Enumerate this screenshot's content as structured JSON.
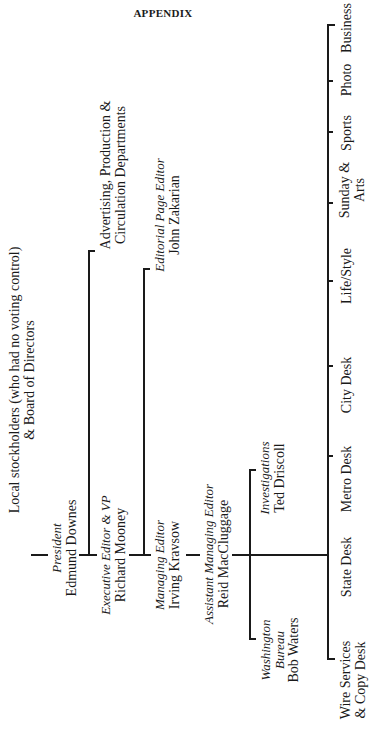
{
  "page": {
    "heading": "APPENDIX"
  },
  "chart": {
    "root": {
      "line1": "Local stockholders (who had no voting control)",
      "line2": "& Board of Directors"
    },
    "president": {
      "title": "President",
      "name": "Edmund Downes"
    },
    "executive_editor": {
      "title": "Executive Editor & VP",
      "name": "Richard Mooney"
    },
    "advertising": {
      "line1": "Advertising, Production &",
      "line2": "Circulation Departments"
    },
    "managing_editor": {
      "title": "Managing Editor",
      "name": "Irving Kravsow"
    },
    "editorial_page": {
      "title": "Editorial Page Editor",
      "name": "John Zakarian"
    },
    "assistant_managing_editor": {
      "title": "Assistant Managing Editor",
      "name": "Reid MacCluggage"
    },
    "washington": {
      "title1": "Washington",
      "title2": "Bureau",
      "name": "Bob Waters"
    },
    "investigations": {
      "title": "Investigations",
      "name": "Ted Driscoll"
    },
    "desks": [
      {
        "line1": "Wire Services",
        "line2": "& Copy Desk"
      },
      {
        "line1": "State Desk",
        "line2": ""
      },
      {
        "line1": "Metro Desk",
        "line2": ""
      },
      {
        "line1": "City Desk",
        "line2": ""
      },
      {
        "line1": "Life/Style",
        "line2": ""
      },
      {
        "line1": "Sunday &",
        "line2": "Arts"
      },
      {
        "line1": "Sports",
        "line2": ""
      },
      {
        "line1": "Photo",
        "line2": ""
      },
      {
        "line1": "Business",
        "line2": ""
      }
    ]
  }
}
